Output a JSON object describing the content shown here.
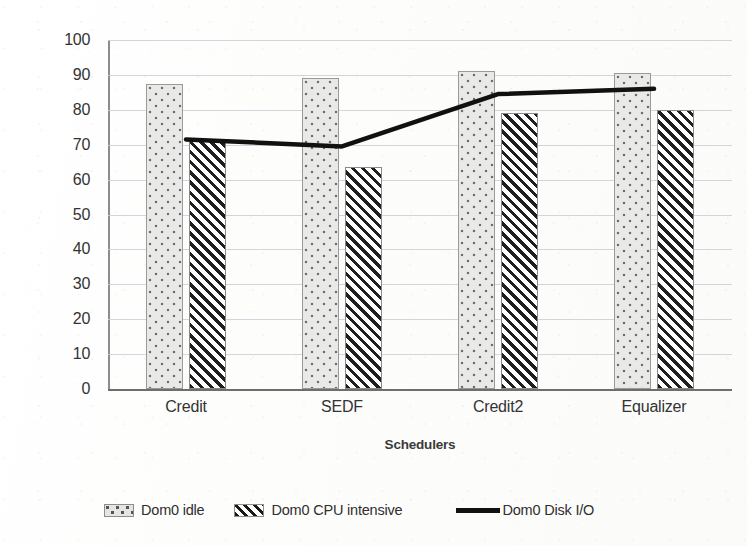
{
  "chart_data": {
    "type": "bar",
    "title": "",
    "xlabel": "Schedulers",
    "ylabel": "Throughput (Mbits/sec)",
    "categories": [
      "Credit",
      "SEDF",
      "Credit2",
      "Equalizer"
    ],
    "ylim": [
      0,
      100
    ],
    "yticks": [
      0,
      10,
      20,
      30,
      40,
      50,
      60,
      70,
      80,
      90,
      100
    ],
    "ytick_labels": [
      "0",
      "10",
      "20",
      "30",
      "40",
      "50",
      "60",
      "70",
      "80",
      "90",
      "100"
    ],
    "grid": true,
    "legend_position": "bottom",
    "series": [
      {
        "name": "Dom0 idle",
        "type": "bar",
        "pattern": "dotted",
        "values": [
          87.5,
          89,
          91,
          90.5
        ]
      },
      {
        "name": "Dom0 CPU intensive",
        "type": "bar",
        "pattern": "diagonal-hatch",
        "values": [
          71.5,
          63.5,
          79,
          80
        ]
      },
      {
        "name": "Dom0 Disk I/O",
        "type": "line",
        "pattern": "solid-line",
        "color": "#111111",
        "values": [
          71.5,
          69.5,
          84.5,
          86
        ]
      }
    ]
  },
  "legend": {
    "items": [
      {
        "label": "Dom0 idle",
        "marker": "dotted-swatch"
      },
      {
        "label": "Dom0 CPU intensive",
        "marker": "hatched-swatch"
      },
      {
        "label": "Dom0 Disk I/O",
        "marker": "line-swatch"
      }
    ]
  },
  "colors": {
    "gridline": "#c9cfd6",
    "axis": "#6e6e6e",
    "line_series": "#111111",
    "bar_dotted_fill": "#e9e9e7",
    "bar_hatch_fill": "#ffffff"
  }
}
